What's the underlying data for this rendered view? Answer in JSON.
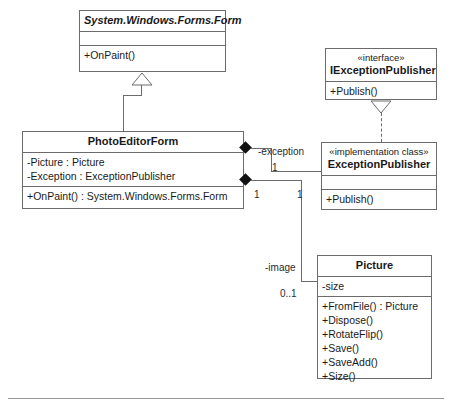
{
  "diagram": {
    "classes": [
      {
        "id": "form",
        "name": "System.Windows.Forms.Form",
        "stereotype": "",
        "attributes": [],
        "operations": [
          "+OnPaint()"
        ]
      },
      {
        "id": "photo_editor_form",
        "name": "PhotoEditorForm",
        "stereotype": "",
        "attributes": [
          "-Picture : Picture",
          "-Exception : ExceptionPublisher"
        ],
        "operations": [
          "+OnPaint() : System.Windows.Forms.Form"
        ]
      },
      {
        "id": "iexception_publisher",
        "name": "IExceptionPublisher",
        "stereotype": "«interface»",
        "attributes": [],
        "operations": [
          "+Publish()"
        ]
      },
      {
        "id": "exception_publisher",
        "name": "ExceptionPublisher",
        "stereotype": "«implementation class»",
        "attributes": [],
        "operations": [
          "+Publish()"
        ]
      },
      {
        "id": "picture",
        "name": "Picture",
        "stereotype": "",
        "attributes": [
          "-size"
        ],
        "operations": [
          "+FromFile() : Picture",
          "+Dispose()",
          "+RotateFlip()",
          "+Save()",
          "+SaveAdd()",
          "+Size()"
        ]
      }
    ],
    "relationships": {
      "generalization": {
        "from": "PhotoEditorForm",
        "to": "System.Windows.Forms.Form"
      },
      "realization": {
        "from": "ExceptionPublisher",
        "to": "IExceptionPublisher"
      },
      "composition_exception": {
        "from": "PhotoEditorForm",
        "to": "ExceptionPublisher",
        "role": "-exception",
        "source_multiplicity": "1",
        "target_multiplicity": "1"
      },
      "composition_image": {
        "from": "PhotoEditorForm",
        "to": "Picture",
        "role": "-image",
        "source_multiplicity": "1",
        "target_multiplicity": "0..1"
      }
    },
    "labels": {
      "exception_role": "-exception",
      "exception_mult_near": "1",
      "image_role": "-image",
      "image_mult_source": "1",
      "image_mult_target": "1",
      "image_mult_far": "0..1"
    }
  },
  "colors": {
    "border": "#6b6b6b",
    "text": "#1a1a1a",
    "diamond": "#111111",
    "rule": "#9a9a9a",
    "background": "#ffffff"
  }
}
